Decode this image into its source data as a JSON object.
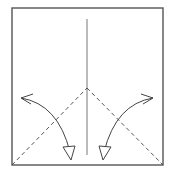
{
  "diagram": {
    "paper": {
      "shape": "square",
      "x": 12,
      "y": 8,
      "width": 151,
      "height": 157,
      "edge_color": "#555555",
      "fill_color": "#ffffff"
    },
    "creases": [
      {
        "name": "center-vertical-crease",
        "type": "existing-crease",
        "x1": 87,
        "y1": 19,
        "x2": 87,
        "y2": 155
      }
    ],
    "fold_lines": [
      {
        "name": "left-valley-fold-line",
        "type": "valley-fold",
        "x1": 12,
        "y1": 165,
        "x2": 87,
        "y2": 88
      },
      {
        "name": "right-valley-fold-line",
        "type": "valley-fold",
        "x1": 87,
        "y1": 88,
        "x2": 163,
        "y2": 165
      }
    ],
    "arrows": [
      {
        "name": "left-fold-arrow",
        "type": "valley-fold-arrow",
        "path": "M21,98 Q58,104 70,152",
        "tail_barb": "M21,98 L33,94 M21,98 L31,104",
        "head": "63,147 75,146 71,160"
      },
      {
        "name": "right-fold-arrow",
        "type": "valley-fold-arrow",
        "path": "M153,98 Q116,104 104,152",
        "tail_barb": "M153,98 L141,94 M153,98 L143,104",
        "head": "111,147 99,146 103,160"
      }
    ],
    "colors": {
      "line": "#444444",
      "edge": "#555555",
      "background": "#ffffff"
    }
  }
}
